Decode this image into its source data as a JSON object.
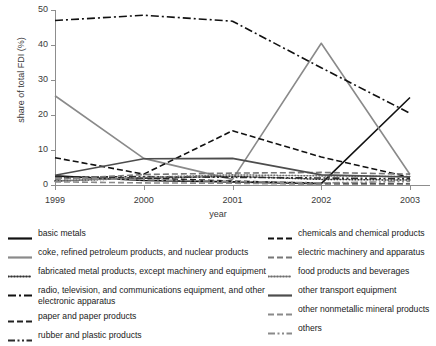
{
  "chart_data": {
    "type": "line",
    "title": "",
    "xlabel": "year",
    "ylabel": "share of total FDI (%)",
    "categories": [
      "1999",
      "2000",
      "2001",
      "2002",
      "2003"
    ],
    "x": [
      1999,
      2000,
      2001,
      2002,
      2003
    ],
    "xlim": [
      1999,
      2003
    ],
    "ylim": [
      0,
      50
    ],
    "yticks": [
      0,
      10,
      20,
      30,
      40,
      50
    ],
    "grid": false,
    "legend_position": "below",
    "series": [
      {
        "name": "basic metals",
        "values": [
          2.6,
          1.3,
          0.9,
          0.4,
          25.0
        ],
        "color": "#111111",
        "style": "solid"
      },
      {
        "name": "coke, refined petroleum products, and nuclear products",
        "values": [
          25.5,
          7.6,
          1.6,
          40.5,
          3.0
        ],
        "color": "#8a8a8a",
        "style": "solid"
      },
      {
        "name": "fabricated metal products, except machinery and equipment",
        "values": [
          1.2,
          1.9,
          2.5,
          1.6,
          1.4
        ],
        "color": "#333333",
        "style": "dotted"
      },
      {
        "name": "radio, television, and communications equipment, and other electronic apparatus",
        "values": [
          47.0,
          48.5,
          46.8,
          33.5,
          20.5
        ],
        "color": "#111111",
        "style": "dashdot"
      },
      {
        "name": "paper and paper products",
        "values": [
          2.3,
          2.0,
          1.1,
          0.5,
          0.3
        ],
        "color": "#222222",
        "style": "dashed"
      },
      {
        "name": "rubber and plastic products",
        "values": [
          2.2,
          2.4,
          2.2,
          2.0,
          1.8
        ],
        "color": "#2b2b2b",
        "style": "dashdotdot"
      },
      {
        "name": "chemicals and chemical products",
        "values": [
          7.8,
          3.1,
          15.5,
          8.0,
          2.2
        ],
        "color": "#111111",
        "style": "dashed"
      },
      {
        "name": "electric machinery and apparatus",
        "values": [
          1.6,
          3.0,
          3.4,
          3.6,
          3.1
        ],
        "color": "#777777",
        "style": "dashed"
      },
      {
        "name": "food products and beverages",
        "values": [
          1.0,
          2.2,
          2.9,
          2.6,
          2.4
        ],
        "color": "#6e6e6e",
        "style": "dotted"
      },
      {
        "name": "other transport equipment",
        "values": [
          2.8,
          7.5,
          7.6,
          2.9,
          2.3
        ],
        "color": "#4d4d4d",
        "style": "solid"
      },
      {
        "name": "other nonmetallic mineral products",
        "values": [
          0.9,
          0.6,
          0.5,
          0.2,
          0.2
        ],
        "color": "#8a8a8a",
        "style": "dashed"
      },
      {
        "name": "others",
        "values": [
          2.0,
          1.5,
          1.0,
          0.6,
          1.0
        ],
        "color": "#8a8a8a",
        "style": "dashdotdot"
      }
    ]
  },
  "legend": {
    "left": [
      {
        "label": "basic metals",
        "swatch": "swatch-basic-metals"
      },
      {
        "label": "coke, refined petroleum products, and nuclear products",
        "swatch": "swatch-coke"
      },
      {
        "label": "fabricated metal products, except machinery and equipment",
        "swatch": "swatch-fabricated-metal"
      },
      {
        "label": "radio, television, and communications equipment, and other electronic apparatus",
        "swatch": "swatch-radio-tv"
      },
      {
        "label": "paper and paper products",
        "swatch": "swatch-paper"
      },
      {
        "label": "rubber and plastic products",
        "swatch": "swatch-rubber"
      }
    ],
    "right": [
      {
        "label": "chemicals and chemical products",
        "swatch": "swatch-chemicals"
      },
      {
        "label": "electric machinery and apparatus",
        "swatch": "swatch-electric-machinery"
      },
      {
        "label": "food products and beverages",
        "swatch": "swatch-food"
      },
      {
        "label": "other transport equipment",
        "swatch": "swatch-other-transport"
      },
      {
        "label": "other nonmetallic mineral products",
        "swatch": "swatch-nonmetallic"
      },
      {
        "label": "others",
        "swatch": "swatch-others"
      }
    ]
  }
}
